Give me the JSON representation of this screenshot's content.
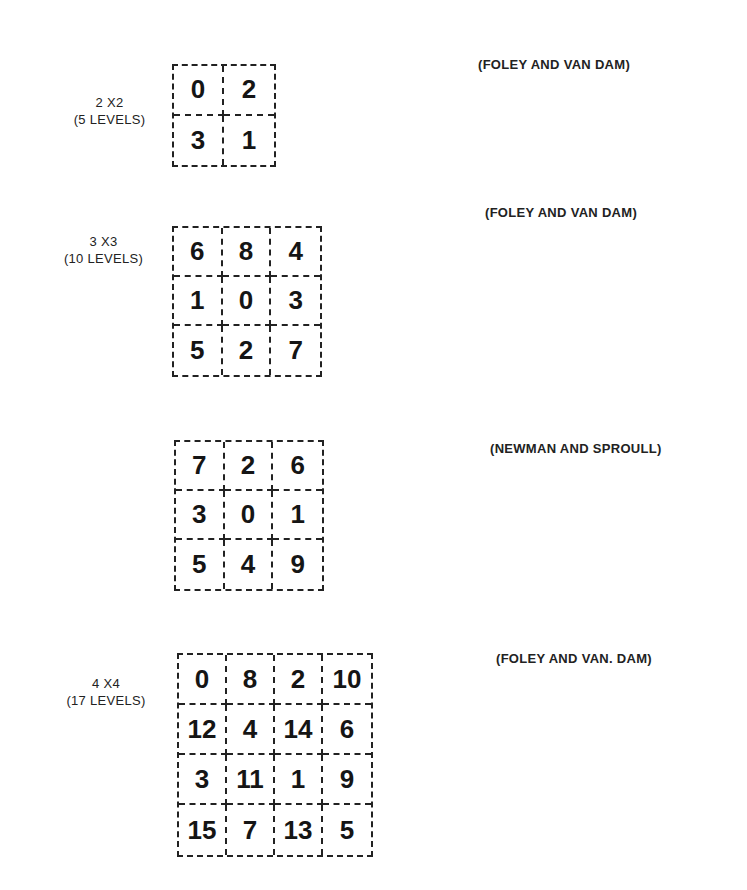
{
  "figures": [
    {
      "label_line1": "2 X2",
      "label_line2": "(5 LEVELS)",
      "citation": "(FOLEY AND VAN DAM)",
      "size": 2,
      "cells": [
        "0",
        "2",
        "3",
        "1"
      ]
    },
    {
      "label_line1": "3 X3",
      "label_line2": "(10 LEVELS)",
      "citation": "(FOLEY AND VAN DAM)",
      "size": 3,
      "cells": [
        "6",
        "8",
        "4",
        "1",
        "0",
        "3",
        "5",
        "2",
        "7"
      ]
    },
    {
      "label_line1": "",
      "label_line2": "",
      "citation": "(NEWMAN AND SPROULL)",
      "size": 3,
      "cells": [
        "7",
        "2",
        "6",
        "3",
        "0",
        "1",
        "5",
        "4",
        "9"
      ]
    },
    {
      "label_line1": "4 X4",
      "label_line2": "(17 LEVELS)",
      "citation": "(FOLEY AND VAN. DAM)",
      "size": 4,
      "cells": [
        "0",
        "8",
        "2",
        "10",
        "12",
        "4",
        "14",
        "6",
        "3",
        "11",
        "1",
        "9",
        "15",
        "7",
        "13",
        "5"
      ]
    }
  ]
}
